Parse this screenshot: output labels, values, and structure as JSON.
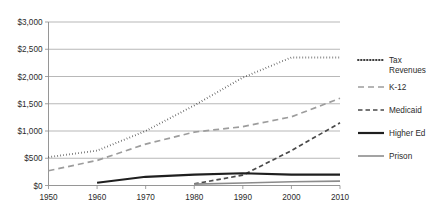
{
  "chart_data": {
    "type": "line",
    "title": "",
    "xlabel": "",
    "ylabel": "",
    "x": [
      1950,
      1960,
      1970,
      1980,
      1990,
      2000,
      2010
    ],
    "categories": [
      "1950",
      "1960",
      "1970",
      "1980",
      "1990",
      "2000",
      "2010"
    ],
    "xlim": [
      1950,
      2010
    ],
    "ylim": [
      0,
      3000
    ],
    "ytick_values": [
      0,
      500,
      1000,
      1500,
      2000,
      2500,
      3000
    ],
    "ytick_labels": [
      "$0",
      "$500",
      "$1,000",
      "$1,500",
      "$2,000",
      "$2,500",
      "$3,000"
    ],
    "grid": true,
    "legend_position": "right",
    "series": [
      {
        "name": "Tax Revenues",
        "style": "dotted",
        "color": "#3a3a3a",
        "x": [
          1950,
          1960,
          1970,
          1980,
          1990,
          2000,
          2010
        ],
        "values": [
          520,
          640,
          1000,
          1470,
          1980,
          2350,
          2350
        ]
      },
      {
        "name": "K-12",
        "style": "long-dash",
        "color": "#9d9d9d",
        "x": [
          1950,
          1960,
          1970,
          1980,
          1990,
          2000,
          2010
        ],
        "values": [
          270,
          460,
          760,
          980,
          1080,
          1260,
          1600
        ]
      },
      {
        "name": "Medicaid",
        "style": "dash",
        "color": "#4a4a4a",
        "x": [
          1980,
          1990,
          2000,
          2010
        ],
        "values": [
          30,
          190,
          640,
          1150
        ]
      },
      {
        "name": "Higher Ed",
        "style": "solid-thick",
        "color": "#1f1f1f",
        "x": [
          1960,
          1970,
          1980,
          1990,
          2000,
          2010
        ],
        "values": [
          50,
          160,
          200,
          225,
          200,
          200
        ]
      },
      {
        "name": "Prison",
        "style": "solid",
        "color": "#8c8c8c",
        "x": [
          1980,
          1990,
          2000,
          2010
        ],
        "values": [
          25,
          45,
          70,
          80
        ]
      }
    ]
  },
  "legend": {
    "items": [
      {
        "label": "Tax Revenues"
      },
      {
        "label": "K-12"
      },
      {
        "label": "Medicaid"
      },
      {
        "label": "Higher Ed"
      },
      {
        "label": "Prison"
      }
    ]
  },
  "axes": {
    "y_labels": [
      "$3,000",
      "$2,500",
      "$2,000",
      "$1,500",
      "$1,000",
      "$500",
      "$0"
    ],
    "x_labels": [
      "1950",
      "1960",
      "1970",
      "1980",
      "1990",
      "2000",
      "2010"
    ]
  }
}
